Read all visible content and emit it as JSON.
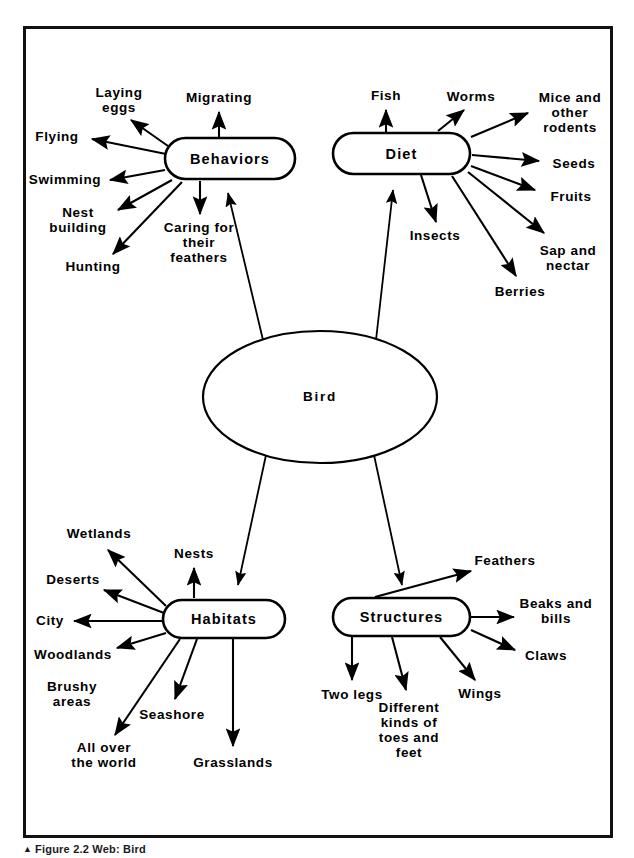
{
  "figure": {
    "caption_marker": "▲",
    "caption_text": "Figure 2.2  Web: Bird",
    "frame_color": "#111111",
    "ink_color": "#000000",
    "background_color": "#ffffff"
  },
  "center": {
    "label": "Bird",
    "shape": "ellipse",
    "cx": 320,
    "cy": 397,
    "rx": 117,
    "ry": 66
  },
  "branches": [
    {
      "id": "behaviors",
      "label": "Behaviors",
      "shape": "rounded-rect",
      "x": 165,
      "y": 138,
      "w": 130,
      "h": 41,
      "leaves": [
        {
          "id": "laying-eggs",
          "label": "Laying\neggs",
          "x": 119,
          "y": 100
        },
        {
          "id": "migrating",
          "label": "Migrating",
          "x": 219,
          "y": 98
        },
        {
          "id": "flying",
          "label": "Flying",
          "x": 57,
          "y": 137
        },
        {
          "id": "swimming",
          "label": "Swimming",
          "x": 65,
          "y": 180
        },
        {
          "id": "nest-building",
          "label": "Nest\nbuilding",
          "x": 78,
          "y": 220
        },
        {
          "id": "hunting",
          "label": "Hunting",
          "x": 93,
          "y": 267
        },
        {
          "id": "caring",
          "label": "Caring for\ntheir\nfeathers",
          "x": 199,
          "y": 243
        }
      ]
    },
    {
      "id": "diet",
      "label": "Diet",
      "shape": "rounded-rect",
      "x": 333,
      "y": 133,
      "w": 137,
      "h": 41,
      "leaves": [
        {
          "id": "fish",
          "label": "Fish",
          "x": 386,
          "y": 96
        },
        {
          "id": "worms",
          "label": "Worms",
          "x": 471,
          "y": 97
        },
        {
          "id": "mice",
          "label": "Mice and\nother\nrodents",
          "x": 570,
          "y": 113
        },
        {
          "id": "seeds",
          "label": "Seeds",
          "x": 574,
          "y": 164
        },
        {
          "id": "fruits",
          "label": "Fruits",
          "x": 571,
          "y": 197
        },
        {
          "id": "insects",
          "label": "Insects",
          "x": 435,
          "y": 236
        },
        {
          "id": "sap",
          "label": "Sap and\nnectar",
          "x": 568,
          "y": 258
        },
        {
          "id": "berries",
          "label": "Berries",
          "x": 520,
          "y": 292
        }
      ]
    },
    {
      "id": "habitats",
      "label": "Habitats",
      "shape": "rounded-rect",
      "x": 163,
      "y": 600,
      "w": 122,
      "h": 38,
      "leaves": [
        {
          "id": "wetlands",
          "label": "Wetlands",
          "x": 99,
          "y": 534
        },
        {
          "id": "nests",
          "label": "Nests",
          "x": 194,
          "y": 554
        },
        {
          "id": "deserts",
          "label": "Deserts",
          "x": 73,
          "y": 580
        },
        {
          "id": "city",
          "label": "City",
          "x": 50,
          "y": 621
        },
        {
          "id": "woodlands",
          "label": "Woodlands",
          "x": 73,
          "y": 655
        },
        {
          "id": "brushy",
          "label": "Brushy\nareas",
          "x": 72,
          "y": 694
        },
        {
          "id": "seashore",
          "label": "Seashore",
          "x": 172,
          "y": 715
        },
        {
          "id": "all-over",
          "label": "All over\nthe world",
          "x": 104,
          "y": 755
        },
        {
          "id": "grasslands",
          "label": "Grasslands",
          "x": 233,
          "y": 763
        }
      ]
    },
    {
      "id": "structures",
      "label": "Structures",
      "shape": "rounded-rect",
      "x": 333,
      "y": 598,
      "w": 137,
      "h": 38,
      "leaves": [
        {
          "id": "feathers",
          "label": "Feathers",
          "x": 505,
          "y": 561
        },
        {
          "id": "beaks",
          "label": "Beaks and\nbills",
          "x": 556,
          "y": 611
        },
        {
          "id": "claws",
          "label": "Claws",
          "x": 546,
          "y": 656
        },
        {
          "id": "two-legs",
          "label": "Two legs",
          "x": 352,
          "y": 695
        },
        {
          "id": "toes",
          "label": "Different\nkinds of\ntoes and\nfeet",
          "x": 409,
          "y": 730
        },
        {
          "id": "wings",
          "label": "Wings",
          "x": 480,
          "y": 694
        }
      ]
    }
  ],
  "connectors": {
    "center_to_branch": [
      {
        "from": "bird",
        "to": "behaviors",
        "x1": 263,
        "y1": 340,
        "x2": 228,
        "y2": 193
      },
      {
        "from": "bird",
        "to": "diet",
        "x1": 376,
        "y1": 340,
        "x2": 393,
        "y2": 190
      },
      {
        "from": "bird",
        "to": "habitats",
        "x1": 266,
        "y1": 455,
        "x2": 238,
        "y2": 585
      },
      {
        "from": "bird",
        "to": "structures",
        "x1": 374,
        "y1": 455,
        "x2": 402,
        "y2": 585
      }
    ],
    "branch_to_leaf": [
      {
        "branch": "behaviors",
        "leaf": "laying-eggs",
        "x1": 168,
        "y1": 146,
        "x2": 131,
        "y2": 120
      },
      {
        "branch": "behaviors",
        "leaf": "migrating",
        "x1": 219,
        "y1": 137,
        "x2": 219,
        "y2": 112
      },
      {
        "branch": "behaviors",
        "leaf": "flying",
        "x1": 166,
        "y1": 154,
        "x2": 92,
        "y2": 139
      },
      {
        "branch": "behaviors",
        "leaf": "swimming",
        "x1": 165,
        "y1": 170,
        "x2": 110,
        "y2": 180
      },
      {
        "branch": "behaviors",
        "leaf": "nest-building",
        "x1": 172,
        "y1": 180,
        "x2": 118,
        "y2": 210
      },
      {
        "branch": "behaviors",
        "leaf": "hunting",
        "x1": 182,
        "y1": 182,
        "x2": 113,
        "y2": 254
      },
      {
        "branch": "behaviors",
        "leaf": "caring",
        "x1": 200,
        "y1": 181,
        "x2": 200,
        "y2": 214
      },
      {
        "branch": "diet",
        "leaf": "fish",
        "x1": 386,
        "y1": 132,
        "x2": 386,
        "y2": 110
      },
      {
        "branch": "diet",
        "leaf": "worms",
        "x1": 438,
        "y1": 131,
        "x2": 464,
        "y2": 110
      },
      {
        "branch": "diet",
        "leaf": "mice",
        "x1": 471,
        "y1": 137,
        "x2": 528,
        "y2": 113
      },
      {
        "branch": "diet",
        "leaf": "seeds",
        "x1": 472,
        "y1": 155,
        "x2": 539,
        "y2": 161
      },
      {
        "branch": "diet",
        "leaf": "fruits",
        "x1": 471,
        "y1": 166,
        "x2": 535,
        "y2": 190
      },
      {
        "branch": "diet",
        "leaf": "insects",
        "x1": 421,
        "y1": 175,
        "x2": 436,
        "y2": 222
      },
      {
        "branch": "diet",
        "leaf": "sap",
        "x1": 468,
        "y1": 172,
        "x2": 544,
        "y2": 233
      },
      {
        "branch": "diet",
        "leaf": "berries",
        "x1": 452,
        "y1": 176,
        "x2": 516,
        "y2": 276
      },
      {
        "branch": "habitats",
        "leaf": "wetlands",
        "x1": 166,
        "y1": 606,
        "x2": 108,
        "y2": 550
      },
      {
        "branch": "habitats",
        "leaf": "nests",
        "x1": 194,
        "y1": 598,
        "x2": 194,
        "y2": 568
      },
      {
        "branch": "habitats",
        "leaf": "deserts",
        "x1": 164,
        "y1": 613,
        "x2": 104,
        "y2": 590
      },
      {
        "branch": "habitats",
        "leaf": "city",
        "x1": 163,
        "y1": 621,
        "x2": 74,
        "y2": 621
      },
      {
        "branch": "habitats",
        "leaf": "woodlands",
        "x1": 166,
        "y1": 633,
        "x2": 117,
        "y2": 648
      },
      {
        "branch": "habitats",
        "leaf": "all-over",
        "x1": 180,
        "y1": 639,
        "x2": 115,
        "y2": 735
      },
      {
        "branch": "habitats",
        "leaf": "seashore",
        "x1": 197,
        "y1": 639,
        "x2": 175,
        "y2": 699
      },
      {
        "branch": "habitats",
        "leaf": "grasslands",
        "x1": 233,
        "y1": 639,
        "x2": 233,
        "y2": 746
      },
      {
        "branch": "structures",
        "leaf": "feathers",
        "x1": 375,
        "y1": 597,
        "x2": 471,
        "y2": 571
      },
      {
        "branch": "structures",
        "leaf": "beaks",
        "x1": 471,
        "y1": 617,
        "x2": 514,
        "y2": 617
      },
      {
        "branch": "structures",
        "leaf": "claws",
        "x1": 471,
        "y1": 630,
        "x2": 515,
        "y2": 650
      },
      {
        "branch": "structures",
        "leaf": "two-legs",
        "x1": 352,
        "y1": 637,
        "x2": 352,
        "y2": 680
      },
      {
        "branch": "structures",
        "leaf": "toes",
        "x1": 392,
        "y1": 637,
        "x2": 406,
        "y2": 690
      },
      {
        "branch": "structures",
        "leaf": "wings",
        "x1": 440,
        "y1": 637,
        "x2": 475,
        "y2": 680
      }
    ]
  }
}
